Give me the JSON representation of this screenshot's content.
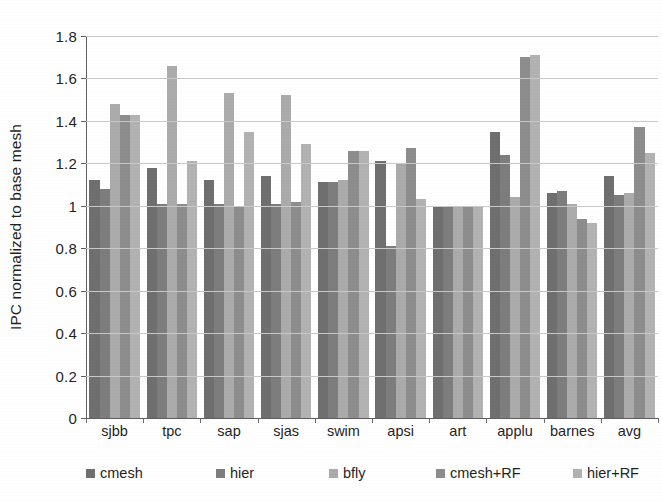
{
  "chart_data": {
    "type": "bar",
    "title": "",
    "xlabel": "",
    "ylabel": "IPC normalized to base mesh",
    "ylim": [
      0,
      1.8
    ],
    "ytick_step": 0.2,
    "yticks": [
      "0",
      "0.2",
      "0.4",
      "0.6",
      "0.8",
      "1",
      "1.2",
      "1.4",
      "1.6",
      "1.8"
    ],
    "grid": true,
    "legend_position": "bottom",
    "categories": [
      "sjbb",
      "tpc",
      "sap",
      "sjas",
      "swim",
      "apsi",
      "art",
      "applu",
      "barnes",
      "avg"
    ],
    "series": [
      {
        "name": "cmesh",
        "color": "#6f6f6f",
        "values": [
          1.12,
          1.18,
          1.12,
          1.14,
          1.11,
          1.21,
          1.0,
          1.35,
          1.06,
          1.14
        ]
      },
      {
        "name": "hier",
        "color": "#7d7d7d",
        "values": [
          1.08,
          1.01,
          1.01,
          1.01,
          1.11,
          0.81,
          1.0,
          1.24,
          1.07,
          1.05
        ]
      },
      {
        "name": "bfly",
        "color": "#ababab",
        "values": [
          1.48,
          1.66,
          1.53,
          1.52,
          1.12,
          1.2,
          1.0,
          1.04,
          1.01,
          1.06
        ]
      },
      {
        "name": "cmesh+RF",
        "color": "#8d8d8d",
        "values": [
          1.43,
          1.01,
          1.0,
          1.02,
          1.26,
          1.27,
          1.0,
          1.7,
          0.94,
          1.37
        ]
      },
      {
        "name": "hier+RF",
        "color": "#b2b2b2",
        "values": [
          1.43,
          1.21,
          1.35,
          1.29,
          1.26,
          1.03,
          1.0,
          1.71,
          0.92,
          1.25
        ]
      }
    ]
  },
  "axis": {
    "y_title": "IPC normalized to base mesh"
  }
}
